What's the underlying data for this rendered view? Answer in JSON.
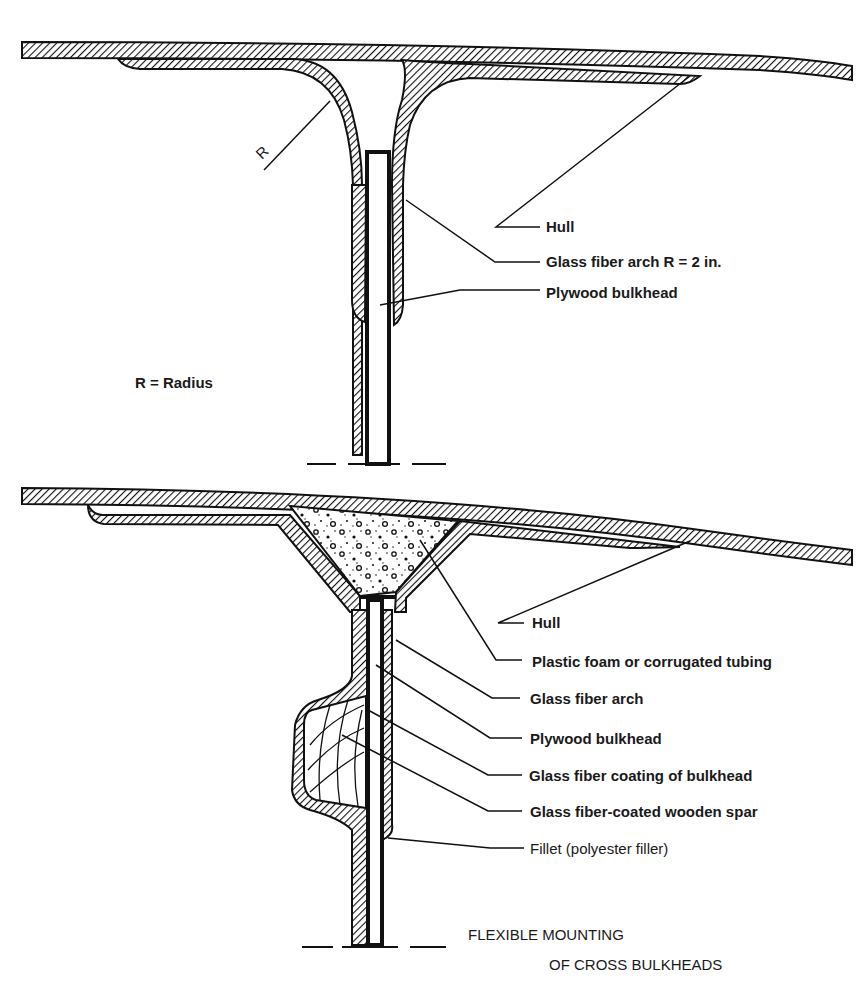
{
  "colors": {
    "ink": "#111111",
    "paper": "#ffffff",
    "hatch_bg": "#ffffff"
  },
  "figure_top": {
    "name": "Rigid mounting with glass fiber arch",
    "radius_marker": "R",
    "legend": "R = Radius",
    "labels": [
      {
        "id": "hull",
        "text": "Hull"
      },
      {
        "id": "arch",
        "text": "Glass fiber arch R = 2 in."
      },
      {
        "id": "bulkhead",
        "text": "Plywood bulkhead"
      }
    ]
  },
  "figure_bottom": {
    "name": "Flexible mounting",
    "labels": [
      {
        "id": "hull",
        "text": "Hull"
      },
      {
        "id": "foam",
        "text": "Plastic foam or corrugated tubing"
      },
      {
        "id": "arch",
        "text": "Glass fiber arch"
      },
      {
        "id": "bulkhead",
        "text": "Plywood  bulkhead"
      },
      {
        "id": "coating",
        "text": "Glass fiber coating of bulkhead"
      },
      {
        "id": "spar",
        "text": "Glass fiber-coated wooden spar"
      },
      {
        "id": "fillet",
        "text": "Fillet (polyester filler)"
      }
    ],
    "caption_line1": "FLEXIBLE MOUNTING",
    "caption_line2": "OF CROSS BULKHEADS"
  }
}
